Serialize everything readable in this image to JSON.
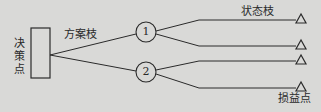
{
  "diagram": {
    "type": "decision-tree",
    "colors": {
      "background": "#d9d9d7",
      "stroke": "#2a2a2a"
    },
    "labels": {
      "decision_point": "决策点",
      "alternative_branch": "方案枝",
      "state_branch": "状态枝",
      "payoff_point": "损益点"
    },
    "chance_nodes": [
      {
        "id": "1",
        "label": "1"
      },
      {
        "id": "2",
        "label": "2"
      }
    ],
    "payoff_nodes": [
      {
        "parent": "1",
        "symbol": "△"
      },
      {
        "parent": "1",
        "symbol": "△"
      },
      {
        "parent": "2",
        "symbol": "△"
      },
      {
        "parent": "2",
        "symbol": "△"
      }
    ]
  }
}
